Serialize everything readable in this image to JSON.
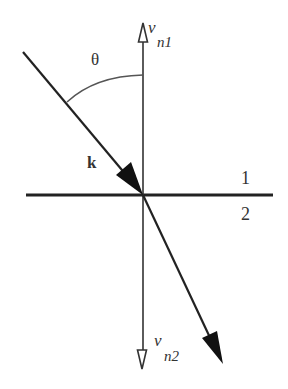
{
  "diagram": {
    "labels": {
      "theta": "θ",
      "wave_vector": "k",
      "medium_top": "1",
      "medium_bottom": "2",
      "normal_top_v": "v",
      "normal_top_sub": "n1",
      "normal_bottom_v": "v",
      "normal_bottom_sub": "n2"
    },
    "elements": [
      {
        "id": "interface-line",
        "type": "line",
        "from": [
          26,
          195
        ],
        "to": [
          273,
          195
        ]
      },
      {
        "id": "normal-axis",
        "type": "line",
        "from": [
          143,
          23
        ],
        "to": [
          143,
          369
        ]
      },
      {
        "id": "incident-ray",
        "type": "arrow",
        "from": [
          23,
          52
        ],
        "to": [
          143,
          195
        ],
        "head": "filled"
      },
      {
        "id": "refracted-ray",
        "type": "arrow",
        "from": [
          143,
          195
        ],
        "to": [
          223,
          364
        ],
        "head": "filled"
      },
      {
        "id": "normal-up-arrow",
        "type": "arrowhead",
        "at": [
          143,
          23
        ],
        "head": "hollow"
      },
      {
        "id": "normal-down-arrow",
        "type": "arrowhead",
        "at": [
          143,
          369
        ],
        "head": "hollow"
      },
      {
        "id": "angle-arc",
        "type": "arc",
        "from": [
          67,
          102
        ],
        "to": [
          143,
          75
        ]
      }
    ],
    "colors": {
      "stroke": "#222222",
      "arc": "#555555",
      "text": "#333333",
      "background": "#ffffff"
    }
  }
}
